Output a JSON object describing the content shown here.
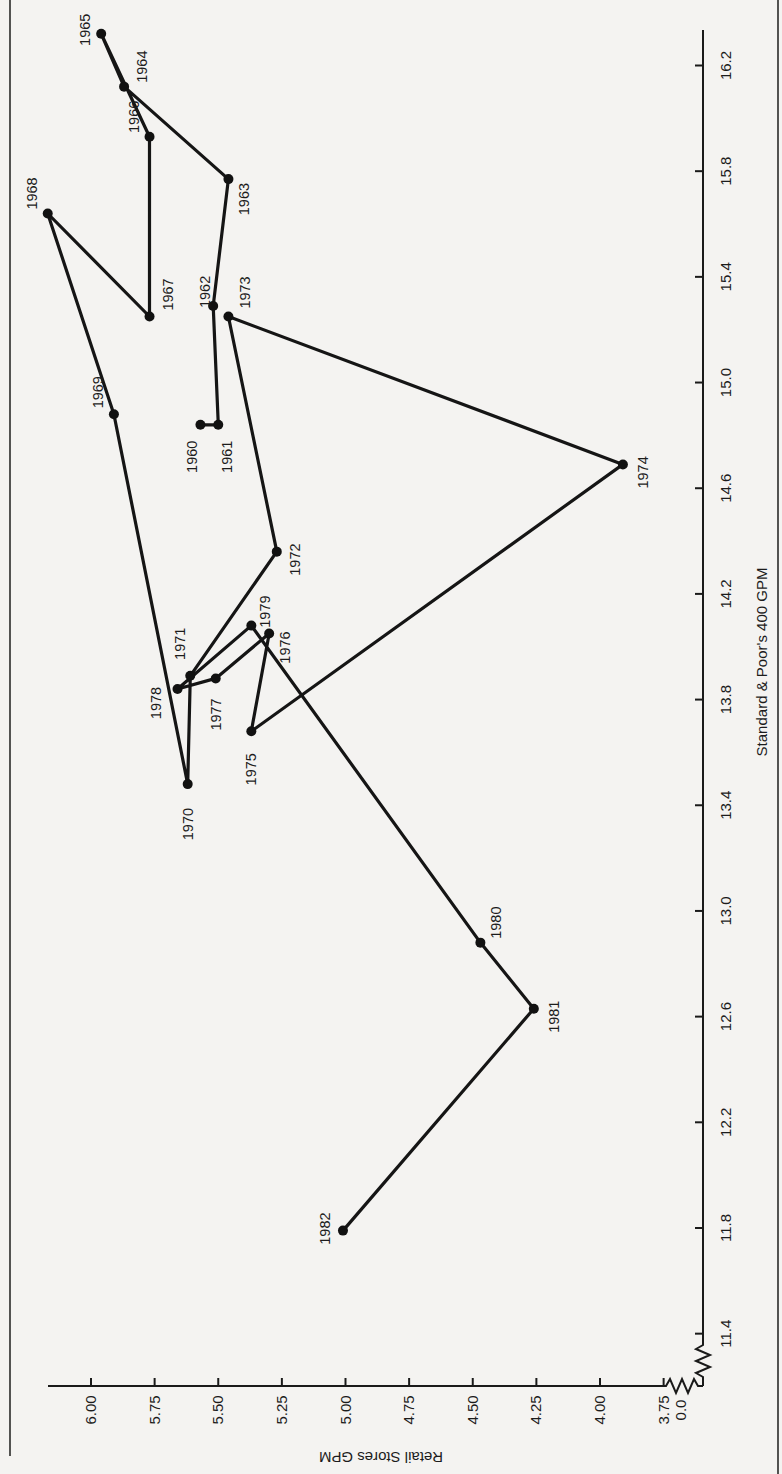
{
  "chart_data": {
    "type": "line",
    "orientation_note": "page rotated 90 degrees counter-clockwise",
    "title": "",
    "xlabel": "Standard & Poor's 400 GPM",
    "ylabel": "Retail Stores GPM",
    "xlim": [
      11.4,
      16.2
    ],
    "ylim": [
      3.75,
      6.0
    ],
    "x_axis_break": true,
    "y_axis_break": true,
    "y_break_label": "0.0",
    "grid": false,
    "legend": "none",
    "x_ticks": [
      "11.4",
      "11.8",
      "12.2",
      "12.6",
      "13.0",
      "13.4",
      "13.8",
      "14.2",
      "14.6",
      "15.0",
      "15.4",
      "15.8",
      "16.2"
    ],
    "y_ticks": [
      "6.00",
      "5.75",
      "5.50",
      "5.25",
      "5.00",
      "4.75",
      "4.50",
      "4.25",
      "4.00",
      "3.75"
    ],
    "series": [
      {
        "name": "Retail Stores vs S&P 400 GPM by year",
        "points": [
          {
            "label": "1960",
            "x": 14.84,
            "y": 5.57
          },
          {
            "label": "1961",
            "x": 14.84,
            "y": 5.5
          },
          {
            "label": "1962",
            "x": 15.29,
            "y": 5.52
          },
          {
            "label": "1963",
            "x": 15.77,
            "y": 5.46
          },
          {
            "label": "1964",
            "x": 16.12,
            "y": 5.87
          },
          {
            "label": "1965",
            "x": 16.32,
            "y": 5.96
          },
          {
            "label": "1966",
            "x": 15.93,
            "y": 5.77
          },
          {
            "label": "1967",
            "x": 15.25,
            "y": 5.77
          },
          {
            "label": "1968",
            "x": 15.64,
            "y": 6.17
          },
          {
            "label": "1969",
            "x": 14.88,
            "y": 5.91
          },
          {
            "label": "1970",
            "x": 13.48,
            "y": 5.62
          },
          {
            "label": "1971",
            "x": 13.89,
            "y": 5.61
          },
          {
            "label": "1972",
            "x": 14.36,
            "y": 5.27
          },
          {
            "label": "1973",
            "x": 15.25,
            "y": 5.46
          },
          {
            "label": "1974",
            "x": 14.69,
            "y": 3.91
          },
          {
            "label": "1975",
            "x": 13.68,
            "y": 5.37
          },
          {
            "label": "1976",
            "x": 14.05,
            "y": 5.3
          },
          {
            "label": "1977",
            "x": 13.88,
            "y": 5.51
          },
          {
            "label": "1978",
            "x": 13.84,
            "y": 5.66
          },
          {
            "label": "1979",
            "x": 14.08,
            "y": 5.37
          },
          {
            "label": "1980",
            "x": 12.88,
            "y": 4.47
          },
          {
            "label": "1981",
            "x": 12.63,
            "y": 4.26
          },
          {
            "label": "1982",
            "x": 11.79,
            "y": 5.01
          }
        ]
      }
    ]
  }
}
